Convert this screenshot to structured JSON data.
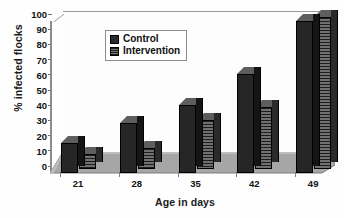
{
  "chart_data": {
    "type": "bar",
    "title": "",
    "subtitle": "",
    "xlabel": "Age in days",
    "ylabel": "% infected flocks",
    "categories": [
      "21",
      "28",
      "35",
      "42",
      "49"
    ],
    "series": [
      {
        "name": "Control",
        "values": [
          20,
          33,
          45,
          65,
          100
        ]
      },
      {
        "name": "Intervention",
        "values": [
          10,
          14,
          32,
          41,
          100
        ]
      }
    ],
    "ylim": [
      0,
      100
    ],
    "yticks": [
      0,
      10,
      20,
      30,
      40,
      50,
      60,
      70,
      80,
      90,
      100
    ],
    "grid": false,
    "legend_position": "top-center-inside",
    "style": "3d-grouped-bar-grayscale"
  },
  "legend": {
    "items": [
      {
        "label": "Control",
        "swatch": "dark-solid"
      },
      {
        "label": "Intervention",
        "swatch": "dark-hatched"
      }
    ]
  },
  "colors": {
    "control": "#262626",
    "intervention": "#3a3a3a",
    "axis": "#8b8b8b",
    "text": "#111111",
    "background": "#ffffff"
  }
}
